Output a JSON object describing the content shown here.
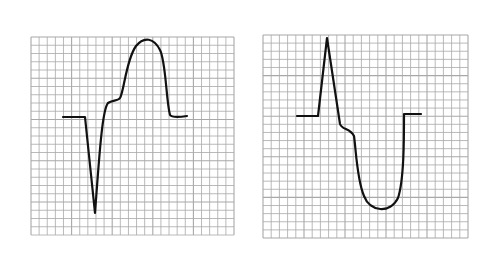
{
  "figure": {
    "panels": [
      {
        "id": "left",
        "description": "Waveform with deep negative spike followed by broad positive dome",
        "grid": {
          "x": 31,
          "y": 37,
          "width": 203,
          "height": 198,
          "cell": 8.1
        },
        "trace": "M63,117 L85,117 L95,213 C99,160 102,110 108,103 C112,100 118,101 120,98 C124,92 126,60 136,46 C144,36 154,38 160,50 C166,62 166,100 170,115 C172,118 180,117 187,116"
      },
      {
        "id": "right",
        "description": "Waveform with sharp positive spike followed by broad negative trough",
        "grid": {
          "x": 263,
          "y": 35,
          "width": 205,
          "height": 203,
          "cell": 8.2
        },
        "trace": "M297,116 L318,116 L327,38 L340,124 C342,130 350,128 354,136 C356,150 357,180 364,196 C370,212 390,214 398,198 C404,180 404,140 404,114 L421,114"
      }
    ],
    "colors": {
      "grid_line": "#a8a8a8",
      "trace": "#111111",
      "background": "#ffffff"
    }
  }
}
